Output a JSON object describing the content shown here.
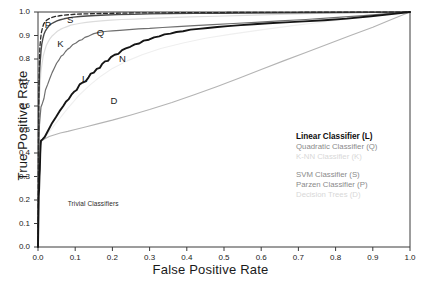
{
  "chart_data": {
    "type": "line",
    "title": "",
    "xlabel": "False Positive Rate",
    "ylabel": "True Positive Rate",
    "xlim": [
      0.0,
      1.0
    ],
    "ylim": [
      0.0,
      1.0
    ],
    "grid": false,
    "legend_position": "center-right",
    "xticks": [
      "0.0",
      "0.1",
      "0.2",
      "0.3",
      "0.4",
      "0.5",
      "0.6",
      "0.7",
      "0.8",
      "0.9",
      "1.0"
    ],
    "yticks": [
      "0.0",
      "0.1",
      "0.2",
      "0.3",
      "0.4",
      "0.5",
      "0.6",
      "0.7",
      "0.8",
      "0.9",
      "1.0"
    ],
    "xtick_values": [
      0.0,
      0.1,
      0.2,
      0.3,
      0.4,
      0.5,
      0.6,
      0.7,
      0.8,
      0.9,
      1.0
    ],
    "ytick_values": [
      0.0,
      0.1,
      0.2,
      0.3,
      0.4,
      0.5,
      0.6,
      0.7,
      0.8,
      0.9,
      1.0
    ],
    "annotations": [
      {
        "text": "Trivial Classifiers",
        "x": 0.08,
        "y": 0.185
      }
    ],
    "curve_tags": [
      {
        "text": "P",
        "x": 0.018,
        "y": 0.945
      },
      {
        "text": "S",
        "x": 0.078,
        "y": 0.965
      },
      {
        "text": "K",
        "x": 0.052,
        "y": 0.862
      },
      {
        "text": "Q",
        "x": 0.158,
        "y": 0.912
      },
      {
        "text": "L",
        "x": 0.118,
        "y": 0.715
      },
      {
        "text": "N",
        "x": 0.218,
        "y": 0.798
      },
      {
        "text": "D",
        "x": 0.195,
        "y": 0.622
      }
    ],
    "series": [
      {
        "name": "Linear Classifier (L)",
        "key": "L",
        "color": "#151515",
        "width": 1.9,
        "dash": "none",
        "points": [
          [
            0.0,
            0.0
          ],
          [
            0.002,
            0.215
          ],
          [
            0.003,
            0.245
          ],
          [
            0.004,
            0.3
          ],
          [
            0.005,
            0.33
          ],
          [
            0.006,
            0.395
          ],
          [
            0.007,
            0.43
          ],
          [
            0.008,
            0.452
          ],
          [
            0.012,
            0.458
          ],
          [
            0.018,
            0.468
          ],
          [
            0.028,
            0.498
          ],
          [
            0.038,
            0.528
          ],
          [
            0.048,
            0.552
          ],
          [
            0.058,
            0.578
          ],
          [
            0.068,
            0.6
          ],
          [
            0.075,
            0.618
          ],
          [
            0.082,
            0.628
          ],
          [
            0.09,
            0.648
          ],
          [
            0.098,
            0.662
          ],
          [
            0.104,
            0.668
          ],
          [
            0.112,
            0.692
          ],
          [
            0.12,
            0.7
          ],
          [
            0.128,
            0.705
          ],
          [
            0.136,
            0.722
          ],
          [
            0.142,
            0.738
          ],
          [
            0.15,
            0.742
          ],
          [
            0.158,
            0.758
          ],
          [
            0.166,
            0.762
          ],
          [
            0.172,
            0.778
          ],
          [
            0.18,
            0.79
          ],
          [
            0.188,
            0.792
          ],
          [
            0.196,
            0.808
          ],
          [
            0.206,
            0.818
          ],
          [
            0.216,
            0.822
          ],
          [
            0.226,
            0.838
          ],
          [
            0.236,
            0.845
          ],
          [
            0.248,
            0.852
          ],
          [
            0.26,
            0.862
          ],
          [
            0.272,
            0.866
          ],
          [
            0.284,
            0.878
          ],
          [
            0.298,
            0.882
          ],
          [
            0.312,
            0.892
          ],
          [
            0.326,
            0.896
          ],
          [
            0.34,
            0.905
          ],
          [
            0.356,
            0.908
          ],
          [
            0.372,
            0.915
          ],
          [
            0.39,
            0.918
          ],
          [
            0.41,
            0.925
          ],
          [
            0.432,
            0.928
          ],
          [
            0.456,
            0.932
          ],
          [
            0.482,
            0.936
          ],
          [
            0.51,
            0.94
          ],
          [
            0.545,
            0.944
          ],
          [
            0.58,
            0.948
          ],
          [
            0.62,
            0.952
          ],
          [
            0.665,
            0.956
          ],
          [
            0.715,
            0.96
          ],
          [
            0.77,
            0.965
          ],
          [
            0.83,
            0.972
          ],
          [
            0.895,
            0.982
          ],
          [
            0.95,
            0.991
          ],
          [
            1.0,
            1.0
          ]
        ]
      },
      {
        "name": "Quadratic Classifier (Q)",
        "key": "Q",
        "color": "#6e6e6e",
        "width": 1.2,
        "dash": "none",
        "points": [
          [
            0.0,
            0.0
          ],
          [
            0.002,
            0.42
          ],
          [
            0.003,
            0.475
          ],
          [
            0.004,
            0.52
          ],
          [
            0.006,
            0.56
          ],
          [
            0.008,
            0.596
          ],
          [
            0.012,
            0.612
          ],
          [
            0.016,
            0.632
          ],
          [
            0.02,
            0.668
          ],
          [
            0.026,
            0.692
          ],
          [
            0.032,
            0.718
          ],
          [
            0.038,
            0.742
          ],
          [
            0.044,
            0.762
          ],
          [
            0.05,
            0.782
          ],
          [
            0.056,
            0.795
          ],
          [
            0.062,
            0.812
          ],
          [
            0.068,
            0.818
          ],
          [
            0.074,
            0.832
          ],
          [
            0.08,
            0.842
          ],
          [
            0.086,
            0.848
          ],
          [
            0.094,
            0.862
          ],
          [
            0.102,
            0.868
          ],
          [
            0.11,
            0.878
          ],
          [
            0.118,
            0.882
          ],
          [
            0.126,
            0.892
          ],
          [
            0.134,
            0.896
          ],
          [
            0.142,
            0.902
          ],
          [
            0.15,
            0.908
          ],
          [
            0.162,
            0.912
          ],
          [
            0.174,
            0.916
          ],
          [
            0.186,
            0.918
          ],
          [
            0.2,
            0.92
          ],
          [
            0.22,
            0.922
          ],
          [
            0.245,
            0.925
          ],
          [
            0.27,
            0.928
          ],
          [
            0.3,
            0.93
          ],
          [
            0.335,
            0.934
          ],
          [
            0.375,
            0.938
          ],
          [
            0.42,
            0.942
          ],
          [
            0.47,
            0.946
          ],
          [
            0.525,
            0.951
          ],
          [
            0.585,
            0.956
          ],
          [
            0.65,
            0.962
          ],
          [
            0.72,
            0.968
          ],
          [
            0.795,
            0.976
          ],
          [
            0.875,
            0.985
          ],
          [
            0.94,
            0.993
          ],
          [
            1.0,
            1.0
          ]
        ]
      },
      {
        "name": "K-NN Classifier (K)",
        "key": "K",
        "color": "#dcdcdc",
        "width": 1.2,
        "dash": "none",
        "points": [
          [
            0.0,
            0.0
          ],
          [
            0.002,
            0.56
          ],
          [
            0.004,
            0.64
          ],
          [
            0.006,
            0.7
          ],
          [
            0.008,
            0.748
          ],
          [
            0.011,
            0.782
          ],
          [
            0.014,
            0.812
          ],
          [
            0.018,
            0.836
          ],
          [
            0.022,
            0.856
          ],
          [
            0.027,
            0.872
          ],
          [
            0.032,
            0.886
          ],
          [
            0.038,
            0.898
          ],
          [
            0.045,
            0.908
          ],
          [
            0.052,
            0.918
          ],
          [
            0.06,
            0.926
          ],
          [
            0.068,
            0.932
          ],
          [
            0.078,
            0.938
          ],
          [
            0.088,
            0.944
          ],
          [
            0.1,
            0.948
          ],
          [
            0.114,
            0.952
          ],
          [
            0.13,
            0.956
          ],
          [
            0.148,
            0.959
          ],
          [
            0.17,
            0.962
          ],
          [
            0.195,
            0.965
          ],
          [
            0.225,
            0.968
          ],
          [
            0.26,
            0.97
          ],
          [
            0.3,
            0.973
          ],
          [
            0.35,
            0.976
          ],
          [
            0.41,
            0.979
          ],
          [
            0.48,
            0.982
          ],
          [
            0.56,
            0.986
          ],
          [
            0.65,
            0.99
          ],
          [
            0.75,
            0.994
          ],
          [
            0.86,
            0.997
          ],
          [
            1.0,
            1.0
          ]
        ]
      },
      {
        "name": "SVM Classifier (S)",
        "key": "S",
        "color": "#4a4a4a",
        "width": 1.4,
        "dash": "none",
        "points": [
          [
            0.0,
            0.0
          ],
          [
            0.002,
            0.6
          ],
          [
            0.003,
            0.68
          ],
          [
            0.004,
            0.735
          ],
          [
            0.006,
            0.79
          ],
          [
            0.008,
            0.832
          ],
          [
            0.01,
            0.862
          ],
          [
            0.013,
            0.886
          ],
          [
            0.016,
            0.905
          ],
          [
            0.02,
            0.92
          ],
          [
            0.025,
            0.932
          ],
          [
            0.03,
            0.942
          ],
          [
            0.036,
            0.95
          ],
          [
            0.043,
            0.956
          ],
          [
            0.051,
            0.962
          ],
          [
            0.06,
            0.967
          ],
          [
            0.07,
            0.971
          ],
          [
            0.082,
            0.975
          ],
          [
            0.096,
            0.978
          ],
          [
            0.112,
            0.981
          ],
          [
            0.132,
            0.983
          ],
          [
            0.155,
            0.985
          ],
          [
            0.182,
            0.987
          ],
          [
            0.215,
            0.989
          ],
          [
            0.255,
            0.99
          ],
          [
            0.3,
            0.992
          ],
          [
            0.355,
            0.993
          ],
          [
            0.42,
            0.994
          ],
          [
            0.495,
            0.995
          ],
          [
            0.58,
            0.996
          ],
          [
            0.68,
            0.997
          ],
          [
            0.79,
            0.998
          ],
          [
            0.9,
            0.999
          ],
          [
            1.0,
            1.0
          ]
        ]
      },
      {
        "name": "Parzen Classifier (P)",
        "key": "P",
        "color": "#2b2b2b",
        "width": 1.3,
        "dash": "4,2.5",
        "points": [
          [
            0.0,
            0.0
          ],
          [
            0.002,
            0.64
          ],
          [
            0.003,
            0.73
          ],
          [
            0.004,
            0.8
          ],
          [
            0.005,
            0.848
          ],
          [
            0.007,
            0.886
          ],
          [
            0.009,
            0.912
          ],
          [
            0.012,
            0.932
          ],
          [
            0.015,
            0.948
          ],
          [
            0.019,
            0.958
          ],
          [
            0.024,
            0.966
          ],
          [
            0.03,
            0.972
          ],
          [
            0.038,
            0.977
          ],
          [
            0.047,
            0.981
          ],
          [
            0.058,
            0.984
          ],
          [
            0.071,
            0.987
          ],
          [
            0.087,
            0.989
          ],
          [
            0.105,
            0.991
          ],
          [
            0.127,
            0.992
          ],
          [
            0.152,
            0.993
          ],
          [
            0.182,
            0.994
          ],
          [
            0.218,
            0.995
          ],
          [
            0.26,
            0.996
          ],
          [
            0.31,
            0.996
          ],
          [
            0.37,
            0.997
          ],
          [
            0.44,
            0.997
          ],
          [
            0.52,
            0.998
          ],
          [
            0.615,
            0.998
          ],
          [
            0.72,
            0.999
          ],
          [
            0.84,
            0.999
          ],
          [
            1.0,
            1.0
          ]
        ]
      },
      {
        "name": "Decision Trees (D)",
        "key": "D",
        "color": "#b4b4b4",
        "width": 1.1,
        "dash": "none",
        "points": [
          [
            0.0,
            0.0
          ],
          [
            0.002,
            0.43
          ],
          [
            0.004,
            0.44
          ],
          [
            0.01,
            0.452
          ],
          [
            0.02,
            0.462
          ],
          [
            0.03,
            0.47
          ],
          [
            0.045,
            0.478
          ],
          [
            0.06,
            0.485
          ],
          [
            0.08,
            0.492
          ],
          [
            0.1,
            0.5
          ],
          [
            0.13,
            0.512
          ],
          [
            0.16,
            0.524
          ],
          [
            0.2,
            0.54
          ],
          [
            0.25,
            0.562
          ],
          [
            0.3,
            0.585
          ],
          [
            0.36,
            0.615
          ],
          [
            0.42,
            0.648
          ],
          [
            0.48,
            0.682
          ],
          [
            0.54,
            0.718
          ],
          [
            0.6,
            0.755
          ],
          [
            0.66,
            0.792
          ],
          [
            0.72,
            0.828
          ],
          [
            0.78,
            0.864
          ],
          [
            0.84,
            0.9
          ],
          [
            0.9,
            0.935
          ],
          [
            0.95,
            0.968
          ],
          [
            1.0,
            1.0
          ]
        ]
      },
      {
        "name": "Trivial diagonal",
        "key": "N",
        "color": "#efefef",
        "width": 1.1,
        "dash": "none",
        "points": [
          [
            0.0,
            0.0
          ],
          [
            0.002,
            0.43
          ],
          [
            0.02,
            0.47
          ],
          [
            0.05,
            0.53
          ],
          [
            0.08,
            0.59
          ],
          [
            0.11,
            0.645
          ],
          [
            0.14,
            0.69
          ],
          [
            0.17,
            0.728
          ],
          [
            0.2,
            0.76
          ],
          [
            0.24,
            0.792
          ],
          [
            0.28,
            0.818
          ],
          [
            0.33,
            0.845
          ],
          [
            0.39,
            0.868
          ],
          [
            0.45,
            0.888
          ],
          [
            0.52,
            0.906
          ],
          [
            0.6,
            0.924
          ],
          [
            0.69,
            0.943
          ],
          [
            0.79,
            0.962
          ],
          [
            0.89,
            0.981
          ],
          [
            1.0,
            1.0
          ]
        ]
      }
    ]
  },
  "legend": {
    "group_one": [
      {
        "label": "Linear Classifier (L)",
        "emphasis": "strong"
      },
      {
        "label": "Quadratic Classifier (Q)",
        "emphasis": "mid"
      },
      {
        "label": "K-NN Classifier (K)",
        "emphasis": "faint"
      }
    ],
    "group_two": [
      {
        "label": "SVM Classifier (S)",
        "emphasis": "mid"
      },
      {
        "label": "Parzen Classifier (P)",
        "emphasis": "mid"
      },
      {
        "label": "Decision Trees (D)",
        "emphasis": "faint"
      }
    ]
  }
}
